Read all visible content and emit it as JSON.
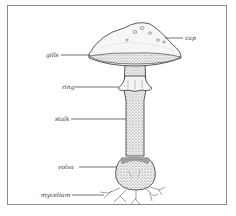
{
  "diagram": {
    "labels": {
      "cap": "cap",
      "gills": "gills",
      "ring": "ring",
      "stalk": "stalk",
      "volva": "volva",
      "mycelium": "mycelium"
    }
  }
}
